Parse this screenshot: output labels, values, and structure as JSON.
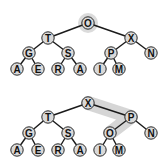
{
  "diagram": {
    "type": "binary-heap-tree-comparison",
    "colors": {
      "node_fill": "#d9d9d9",
      "node_stroke": "#2a2a2a",
      "edge": "#1a1a1a",
      "highlight": "#c8c8c8"
    },
    "trees": [
      {
        "name": "before",
        "highlight_root_halo": true,
        "nodes": [
          {
            "id": "t1n0",
            "label": "O",
            "x": 88,
            "y": 23
          },
          {
            "id": "t1n1",
            "label": "T",
            "x": 48,
            "y": 38
          },
          {
            "id": "t1n2",
            "label": "X",
            "x": 131,
            "y": 38
          },
          {
            "id": "t1n3",
            "label": "G",
            "x": 29,
            "y": 53
          },
          {
            "id": "t1n4",
            "label": "S",
            "x": 68,
            "y": 53
          },
          {
            "id": "t1n5",
            "label": "P",
            "x": 111,
            "y": 53
          },
          {
            "id": "t1n6",
            "label": "N",
            "x": 151,
            "y": 53
          },
          {
            "id": "t1n7",
            "label": "A",
            "x": 17,
            "y": 69
          },
          {
            "id": "t1n8",
            "label": "E",
            "x": 38,
            "y": 69
          },
          {
            "id": "t1n9",
            "label": "R",
            "x": 58,
            "y": 69
          },
          {
            "id": "t1n10",
            "label": "A",
            "x": 80,
            "y": 69
          },
          {
            "id": "t1n11",
            "label": "I",
            "x": 100,
            "y": 69
          },
          {
            "id": "t1n12",
            "label": "M",
            "x": 119,
            "y": 69
          }
        ],
        "edges": [
          [
            "t1n0",
            "t1n1"
          ],
          [
            "t1n0",
            "t1n2"
          ],
          [
            "t1n1",
            "t1n3"
          ],
          [
            "t1n1",
            "t1n4"
          ],
          [
            "t1n2",
            "t1n5"
          ],
          [
            "t1n2",
            "t1n6"
          ],
          [
            "t1n3",
            "t1n7"
          ],
          [
            "t1n3",
            "t1n8"
          ],
          [
            "t1n4",
            "t1n9"
          ],
          [
            "t1n4",
            "t1n10"
          ],
          [
            "t1n5",
            "t1n11"
          ],
          [
            "t1n5",
            "t1n12"
          ]
        ]
      },
      {
        "name": "after",
        "highlight_path": [
          "t2n0",
          "t2n2",
          "t2n5"
        ],
        "nodes": [
          {
            "id": "t2n0",
            "label": "X",
            "x": 88,
            "y": 103
          },
          {
            "id": "t2n1",
            "label": "T",
            "x": 48,
            "y": 117
          },
          {
            "id": "t2n2",
            "label": "P",
            "x": 131,
            "y": 117
          },
          {
            "id": "t2n3",
            "label": "G",
            "x": 29,
            "y": 133
          },
          {
            "id": "t2n4",
            "label": "S",
            "x": 68,
            "y": 133
          },
          {
            "id": "t2n5",
            "label": "O",
            "x": 110,
            "y": 133
          },
          {
            "id": "t2n6",
            "label": "N",
            "x": 151,
            "y": 133
          },
          {
            "id": "t2n7",
            "label": "A",
            "x": 17,
            "y": 150
          },
          {
            "id": "t2n8",
            "label": "E",
            "x": 38,
            "y": 150
          },
          {
            "id": "t2n9",
            "label": "R",
            "x": 58,
            "y": 150
          },
          {
            "id": "t2n10",
            "label": "A",
            "x": 80,
            "y": 150
          },
          {
            "id": "t2n11",
            "label": "I",
            "x": 100,
            "y": 150
          },
          {
            "id": "t2n12",
            "label": "M",
            "x": 119,
            "y": 150
          }
        ],
        "edges": [
          [
            "t2n0",
            "t2n1"
          ],
          [
            "t2n0",
            "t2n2"
          ],
          [
            "t2n1",
            "t2n3"
          ],
          [
            "t2n1",
            "t2n4"
          ],
          [
            "t2n2",
            "t2n5"
          ],
          [
            "t2n2",
            "t2n6"
          ],
          [
            "t2n3",
            "t2n7"
          ],
          [
            "t2n3",
            "t2n8"
          ],
          [
            "t2n4",
            "t2n9"
          ],
          [
            "t2n4",
            "t2n10"
          ],
          [
            "t2n5",
            "t2n11"
          ],
          [
            "t2n5",
            "t2n12"
          ]
        ]
      }
    ]
  }
}
